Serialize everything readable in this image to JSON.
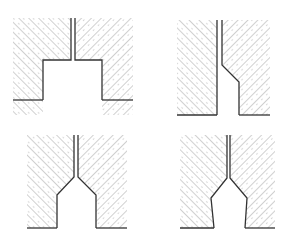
{
  "header": {
    "cut_off_caption_left": "",
    "cut_off_caption_right": ""
  },
  "figure": {
    "hatch_color": "#8a8a8a",
    "outline_color": "#333333",
    "background": "#ffffff",
    "panels": [
      {
        "id": "top-left",
        "profile": "stepped rectangular notch"
      },
      {
        "id": "top-right",
        "profile": "one-sided chamfered step"
      },
      {
        "id": "bottom-left",
        "profile": "symmetric chamfered notch with vertical walls"
      },
      {
        "id": "bottom-right",
        "profile": "symmetric chamfered notch with tapered walls"
      }
    ]
  }
}
